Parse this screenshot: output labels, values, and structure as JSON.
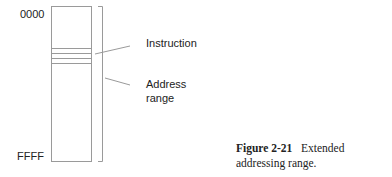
{
  "diagram": {
    "addresses": {
      "start": "0000",
      "end": "FFFF"
    },
    "callouts": {
      "instruction": "Instruction",
      "address_range_line1": "Address",
      "address_range_line2": "range"
    }
  },
  "caption": {
    "figure_number": "Figure 2-21",
    "text": "Extended addressing range."
  },
  "colors": {
    "line": "#9a9a9a",
    "text": "#222222"
  }
}
